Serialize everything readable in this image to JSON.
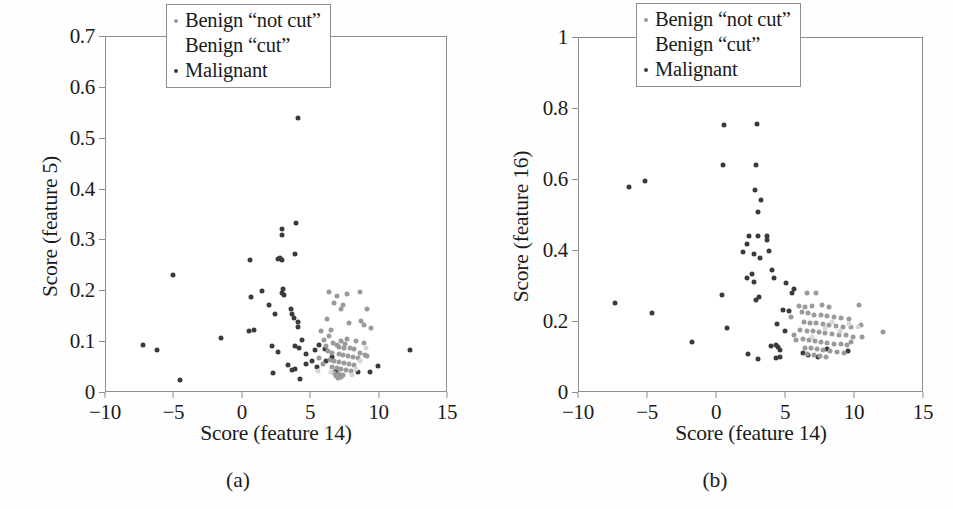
{
  "figure": {
    "panels": [
      {
        "id": "a",
        "subcaption": "(a)",
        "legend": {
          "items": [
            {
              "label": "Benign “not cut”",
              "marker": "notcut",
              "color": "#9a9a9a"
            },
            {
              "label": "Benign “cut”",
              "marker": "cut",
              "color": "#d6d6d6"
            },
            {
              "label": "Malignant",
              "marker": "malignant",
              "color": "#3b3b3b"
            }
          ]
        }
      },
      {
        "id": "b",
        "subcaption": "(b)",
        "legend": {
          "items": [
            {
              "label": "Benign “not cut”",
              "marker": "notcut",
              "color": "#9a9a9a"
            },
            {
              "label": "Benign “cut”",
              "marker": "cut",
              "color": "#d6d6d6"
            },
            {
              "label": "Malignant",
              "marker": "malignant",
              "color": "#3b3b3b"
            }
          ]
        }
      }
    ]
  },
  "chart_data": [
    {
      "type": "scatter",
      "panel": "a",
      "title": "",
      "xlabel": "Score (feature 14)",
      "ylabel": "Score (feature 5)",
      "xlim": [
        -10,
        15
      ],
      "ylim": [
        0,
        0.7
      ],
      "xticks": [
        -10,
        -5,
        0,
        5,
        10,
        15
      ],
      "xticklabels": [
        "−10",
        "−5",
        "0",
        "5",
        "10",
        "15"
      ],
      "yticks": [
        0,
        0.1,
        0.2,
        0.3,
        0.4,
        0.5,
        0.6,
        0.7
      ],
      "yticklabels": [
        "0",
        "0.1",
        "0.2",
        "0.3",
        "0.4",
        "0.5",
        "0.6",
        "0.7"
      ],
      "grid": false,
      "legend_position": "upper right",
      "series": [
        {
          "name": "Malignant",
          "color": "#3b3b3b",
          "points": [
            [
              4.0,
              0.541
            ],
            [
              3.9,
              0.335
            ],
            [
              2.9,
              0.323
            ],
            [
              2.9,
              0.311
            ],
            [
              3.8,
              0.273
            ],
            [
              0.5,
              0.262
            ],
            [
              2.6,
              0.263
            ],
            [
              2.9,
              0.262
            ],
            [
              2.75,
              0.265
            ],
            [
              -5.1,
              0.232
            ],
            [
              1.4,
              0.201
            ],
            [
              2.95,
              0.204
            ],
            [
              2.85,
              0.196
            ],
            [
              3.0,
              0.193
            ],
            [
              0.6,
              0.188
            ],
            [
              1.9,
              0.173
            ],
            [
              3.55,
              0.165
            ],
            [
              2.35,
              0.155
            ],
            [
              3.75,
              0.148
            ],
            [
              3.6,
              0.155
            ],
            [
              4.0,
              0.139
            ],
            [
              4.05,
              0.129
            ],
            [
              0.45,
              0.122
            ],
            [
              0.85,
              0.124
            ],
            [
              -1.6,
              0.108
            ],
            [
              4.3,
              0.104
            ],
            [
              2.15,
              0.092
            ],
            [
              3.85,
              0.093
            ],
            [
              -7.3,
              0.094
            ],
            [
              -6.3,
              0.085
            ],
            [
              4.1,
              0.089
            ],
            [
              2.55,
              0.081
            ],
            [
              2.2,
              0.039
            ],
            [
              3.6,
              0.046
            ],
            [
              3.85,
              0.047
            ],
            [
              3.3,
              0.055
            ],
            [
              4.2,
              0.027
            ],
            [
              -4.6,
              0.025
            ],
            [
              5.05,
              0.063
            ],
            [
              4.6,
              0.077
            ],
            [
              5.3,
              0.085
            ],
            [
              5.6,
              0.095
            ],
            [
              4.65,
              0.058
            ],
            [
              5.4,
              0.052
            ],
            [
              6.0,
              0.087
            ],
            [
              6.1,
              0.063
            ],
            [
              6.5,
              0.071
            ],
            [
              8.4,
              0.042
            ],
            [
              9.3,
              0.041
            ],
            [
              9.9,
              0.053
            ],
            [
              12.2,
              0.085
            ],
            [
              6.8,
              0.044
            ]
          ]
        },
        {
          "name": "Benign “not cut”",
          "color": "#9a9a9a",
          "points": [
            [
              6.3,
              0.199
            ],
            [
              6.9,
              0.191
            ],
            [
              7.6,
              0.194
            ],
            [
              8.6,
              0.199
            ],
            [
              6.7,
              0.176
            ],
            [
              7.3,
              0.173
            ],
            [
              7.15,
              0.166
            ],
            [
              9.1,
              0.165
            ],
            [
              7.75,
              0.137
            ],
            [
              8.65,
              0.141
            ],
            [
              8.85,
              0.134
            ],
            [
              6.45,
              0.124
            ],
            [
              6.3,
              0.112
            ],
            [
              5.95,
              0.105
            ],
            [
              7.2,
              0.102
            ],
            [
              8.3,
              0.102
            ],
            [
              8.85,
              0.098
            ],
            [
              7.5,
              0.097
            ],
            [
              6.85,
              0.094
            ],
            [
              6.6,
              0.098
            ],
            [
              7.05,
              0.091
            ],
            [
              7.4,
              0.088
            ],
            [
              7.8,
              0.088
            ],
            [
              8.1,
              0.086
            ],
            [
              6.2,
              0.082
            ],
            [
              6.55,
              0.079
            ],
            [
              7.0,
              0.077
            ],
            [
              7.35,
              0.075
            ],
            [
              7.7,
              0.073
            ],
            [
              8.05,
              0.071
            ],
            [
              8.4,
              0.069
            ],
            [
              6.35,
              0.065
            ],
            [
              6.7,
              0.063
            ],
            [
              7.05,
              0.061
            ],
            [
              7.4,
              0.059
            ],
            [
              7.75,
              0.057
            ],
            [
              8.1,
              0.055
            ],
            [
              6.5,
              0.051
            ],
            [
              6.85,
              0.049
            ],
            [
              7.2,
              0.047
            ],
            [
              7.55,
              0.045
            ],
            [
              7.9,
              0.043
            ],
            [
              6.65,
              0.039
            ],
            [
              7.0,
              0.037
            ],
            [
              7.35,
              0.035
            ],
            [
              6.8,
              0.033
            ],
            [
              7.15,
              0.031
            ],
            [
              6.95,
              0.029
            ],
            [
              5.85,
              0.057
            ],
            [
              5.6,
              0.069
            ],
            [
              6.05,
              0.093
            ],
            [
              8.55,
              0.078
            ],
            [
              8.9,
              0.074
            ],
            [
              9.1,
              0.072
            ],
            [
              7.6,
              0.106
            ],
            [
              5.75,
              0.121
            ],
            [
              6.15,
              0.146
            ],
            [
              9.35,
              0.128
            ]
          ]
        },
        {
          "name": "Benign “cut”",
          "color": "#d6d6d6",
          "points": [
            [
              8.25,
              0.048
            ],
            [
              7.95,
              0.035
            ],
            [
              6.45,
              0.042
            ],
            [
              8.6,
              0.063
            ],
            [
              5.5,
              0.044
            ],
            [
              9.0,
              0.089
            ]
          ]
        }
      ]
    },
    {
      "type": "scatter",
      "panel": "b",
      "title": "",
      "xlabel": "Score (feature 14)",
      "ylabel": "Score (feature 16)",
      "xlim": [
        -10,
        15
      ],
      "ylim": [
        0,
        1
      ],
      "xticks": [
        -10,
        -5,
        0,
        5,
        10,
        15
      ],
      "xticklabels": [
        "−10",
        "−5",
        "0",
        "5",
        "10",
        "15"
      ],
      "yticks": [
        0,
        0.2,
        0.4,
        0.6,
        0.8,
        1
      ],
      "yticklabels": [
        "0",
        "0.2",
        "0.4",
        "0.6",
        "0.8",
        "1"
      ],
      "grid": false,
      "legend_position": "upper right",
      "series": [
        {
          "name": "Malignant",
          "color": "#3b3b3b",
          "points": [
            [
              0.5,
              0.755
            ],
            [
              2.9,
              0.757
            ],
            [
              0.4,
              0.641
            ],
            [
              2.85,
              0.642
            ],
            [
              -6.4,
              0.58
            ],
            [
              -5.2,
              0.596
            ],
            [
              2.75,
              0.572
            ],
            [
              3.2,
              0.545
            ],
            [
              2.95,
              0.51
            ],
            [
              2.35,
              0.443
            ],
            [
              3.0,
              0.441
            ],
            [
              3.6,
              0.443
            ],
            [
              3.65,
              0.43
            ],
            [
              2.2,
              0.419
            ],
            [
              1.9,
              0.396
            ],
            [
              2.7,
              0.391
            ],
            [
              3.1,
              0.381
            ],
            [
              3.75,
              0.401
            ],
            [
              2.5,
              0.334
            ],
            [
              4.0,
              0.347
            ],
            [
              2.2,
              0.323
            ],
            [
              2.65,
              0.313
            ],
            [
              4.15,
              0.323
            ],
            [
              5.0,
              0.309
            ],
            [
              5.6,
              0.292
            ],
            [
              5.45,
              0.281
            ],
            [
              0.35,
              0.277
            ],
            [
              3.05,
              0.271
            ],
            [
              2.85,
              0.261
            ],
            [
              -7.4,
              0.253
            ],
            [
              -4.7,
              0.224
            ],
            [
              0.7,
              0.184
            ],
            [
              4.35,
              0.193
            ],
            [
              4.75,
              0.234
            ],
            [
              5.2,
              0.231
            ],
            [
              -1.8,
              0.143
            ],
            [
              3.9,
              0.131
            ],
            [
              4.25,
              0.136
            ],
            [
              4.45,
              0.129
            ],
            [
              4.6,
              0.121
            ],
            [
              2.25,
              0.111
            ],
            [
              2.95,
              0.096
            ],
            [
              4.3,
              0.099
            ],
            [
              4.55,
              0.101
            ],
            [
              6.25,
              0.113
            ],
            [
              6.6,
              0.106
            ],
            [
              7.3,
              0.102
            ],
            [
              8.0,
              0.124
            ],
            [
              9.5,
              0.118
            ],
            [
              4.9,
              0.174
            ]
          ]
        },
        {
          "name": "Benign “not cut”",
          "color": "#9a9a9a",
          "points": [
            [
              6.5,
              0.283
            ],
            [
              7.2,
              0.281
            ],
            [
              5.95,
              0.246
            ],
            [
              6.4,
              0.241
            ],
            [
              6.85,
              0.244
            ],
            [
              7.6,
              0.247
            ],
            [
              8.1,
              0.241
            ],
            [
              10.3,
              0.249
            ],
            [
              6.15,
              0.228
            ],
            [
              6.6,
              0.224
            ],
            [
              7.05,
              0.221
            ],
            [
              7.5,
              0.219
            ],
            [
              8.0,
              0.216
            ],
            [
              8.5,
              0.213
            ],
            [
              9.0,
              0.211
            ],
            [
              9.55,
              0.209
            ],
            [
              6.3,
              0.201
            ],
            [
              6.75,
              0.198
            ],
            [
              7.2,
              0.196
            ],
            [
              7.65,
              0.194
            ],
            [
              8.15,
              0.192
            ],
            [
              8.65,
              0.189
            ],
            [
              9.15,
              0.187
            ],
            [
              9.7,
              0.185
            ],
            [
              10.4,
              0.191
            ],
            [
              12.0,
              0.173
            ],
            [
              6.05,
              0.178
            ],
            [
              6.5,
              0.176
            ],
            [
              6.95,
              0.174
            ],
            [
              7.4,
              0.171
            ],
            [
              7.85,
              0.169
            ],
            [
              8.35,
              0.166
            ],
            [
              8.85,
              0.164
            ],
            [
              9.35,
              0.162
            ],
            [
              9.85,
              0.159
            ],
            [
              10.5,
              0.157
            ],
            [
              6.2,
              0.152
            ],
            [
              6.65,
              0.149
            ],
            [
              7.1,
              0.147
            ],
            [
              7.55,
              0.145
            ],
            [
              8.0,
              0.142
            ],
            [
              8.5,
              0.139
            ],
            [
              9.0,
              0.137
            ],
            [
              9.4,
              0.134
            ],
            [
              6.35,
              0.128
            ],
            [
              6.8,
              0.126
            ],
            [
              7.25,
              0.123
            ],
            [
              7.7,
              0.121
            ],
            [
              8.2,
              0.118
            ],
            [
              8.7,
              0.116
            ],
            [
              9.2,
              0.114
            ],
            [
              6.55,
              0.109
            ],
            [
              7.0,
              0.107
            ],
            [
              7.45,
              0.104
            ],
            [
              7.9,
              0.102
            ],
            [
              5.55,
              0.163
            ],
            [
              5.75,
              0.148
            ],
            [
              5.35,
              0.215
            ],
            [
              9.7,
              0.143
            ]
          ]
        },
        {
          "name": "Benign “cut”",
          "color": "#d6d6d6",
          "points": [
            [
              8.3,
              0.201
            ],
            [
              7.8,
              0.182
            ],
            [
              8.9,
              0.175
            ],
            [
              10.2,
              0.186
            ],
            [
              6.9,
              0.158
            ],
            [
              9.6,
              0.195
            ]
          ]
        }
      ]
    }
  ]
}
